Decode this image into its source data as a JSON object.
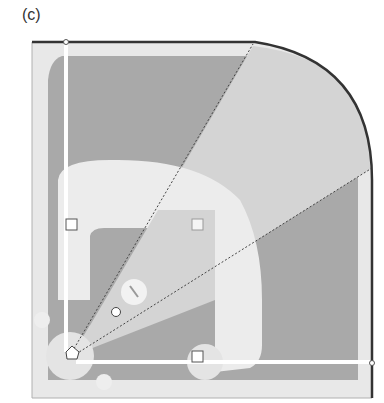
{
  "panel_label": "(c)",
  "diagram": {
    "elements": {
      "bases": [
        "first-base",
        "second-base",
        "third-base"
      ],
      "home_plate": "home-plate",
      "pitchers_mound": "pitchers-mound",
      "ball": "baseball",
      "foul_lines": [
        "left-foul-line",
        "right-foul-line"
      ],
      "sector_lines": [
        "sector-line-left",
        "sector-line-right"
      ],
      "circles": [
        "on-deck-circle-left",
        "on-deck-circle-bottom"
      ]
    },
    "colors": {
      "frame": "#e6e6e6",
      "dark_grass": "#a8a8a8",
      "light_zone": "#d6d6d6",
      "infield_dirt": "#f0f0f0",
      "line": "#ffffff",
      "border": "#333333"
    }
  }
}
